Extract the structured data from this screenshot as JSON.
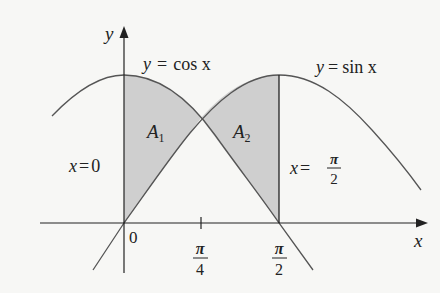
{
  "diagram": {
    "axes": {
      "x_label": "x",
      "y_label": "y",
      "origin_label": "0",
      "ticks": [
        {
          "num": "π",
          "den": "4"
        },
        {
          "num": "π",
          "den": "2"
        }
      ]
    },
    "curves": [
      {
        "name": "cos",
        "label_lhs": "y",
        "label_eq": "=",
        "label_rhs": "cos x"
      },
      {
        "name": "sin",
        "label_lhs": "y",
        "label_eq": "=",
        "label_rhs": "sin x"
      }
    ],
    "boundaries": [
      {
        "lhs": "x",
        "eq": "=",
        "rhs": "0"
      },
      {
        "lhs": "x",
        "eq": "=",
        "num": "π",
        "den": "2"
      }
    ],
    "regions": [
      {
        "name": "A",
        "sub": "1"
      },
      {
        "name": "A",
        "sub": "2"
      }
    ],
    "colors": {
      "shade": "#cfcfcf",
      "curve": "#555555",
      "axis": "#222222",
      "background": "#f7f7f5"
    }
  }
}
